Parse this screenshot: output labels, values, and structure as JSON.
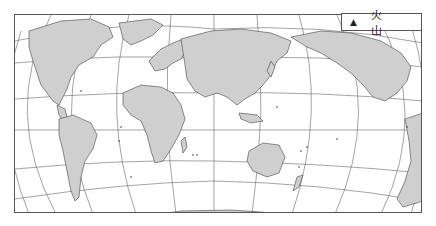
{
  "map": {
    "title": "",
    "projection": "world-curved-graticule",
    "land_color": "#cfcfcf",
    "coast_color": "#444444",
    "grid_color": "#666666",
    "background": "#ffffff"
  },
  "legend": {
    "symbol": "▲",
    "label": "火 山",
    "meaning": "volcano"
  },
  "continents": [
    "North America",
    "South America",
    "Europe",
    "Africa",
    "Asia",
    "Australia",
    "Antarctica",
    "North America (right repeat)"
  ]
}
